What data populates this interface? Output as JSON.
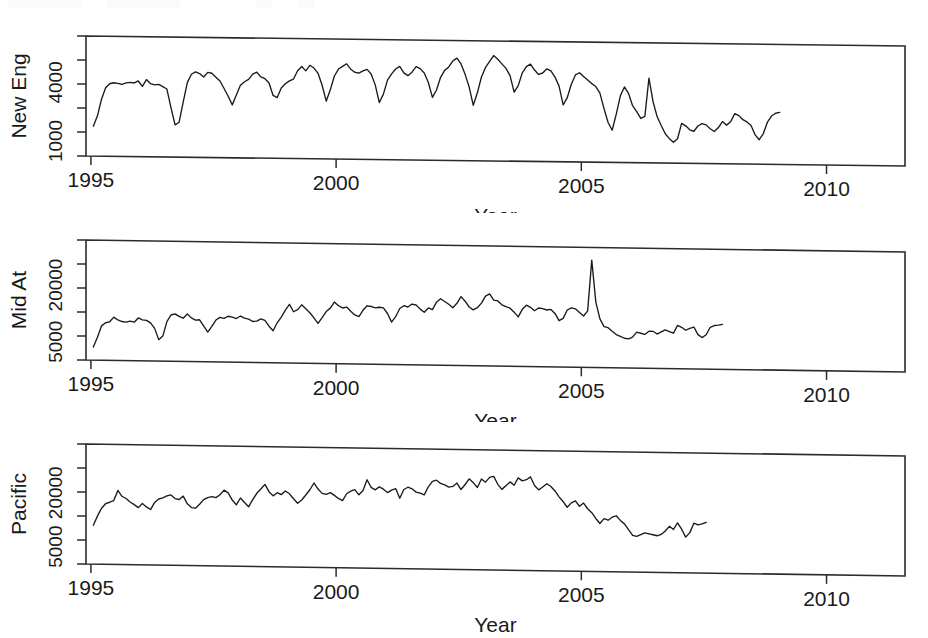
{
  "figure": {
    "kind": "multi-panel-time-series",
    "panel_count": 3,
    "background_color": "#ffffff",
    "line_color": "#1a1a1a"
  },
  "panels": [
    {
      "id": "new-eng",
      "ylabel": "New Eng",
      "xlabel": "Year",
      "yticklabels": [
        "1000",
        "4000"
      ],
      "xticklabels": [
        "1995",
        "2000",
        "2005",
        "2010"
      ]
    },
    {
      "id": "mid-at",
      "ylabel": "Mid At",
      "xlabel": "Year",
      "yticklabels": [
        "5000",
        "20000"
      ],
      "xticklabels": [
        "1995",
        "2000",
        "2005",
        "2010"
      ]
    },
    {
      "id": "pacific",
      "ylabel": "Pacific",
      "xlabel": "Year",
      "yticklabels": [
        "5000",
        "20000"
      ],
      "xticklabels": [
        "1995",
        "2000",
        "2005",
        "2010"
      ]
    }
  ],
  "chart_data": [
    {
      "type": "line",
      "title": "",
      "xlabel": "Year",
      "ylabel": "New Eng",
      "yscale": "log",
      "grid": false,
      "legend": "none",
      "xlim": [
        1994.9,
        2011.6
      ],
      "ylim": [
        700,
        12000
      ],
      "xticks": [
        1995,
        2000,
        2005,
        2010
      ],
      "yticks": [
        1000,
        4000
      ],
      "ytick_labels": [
        "1000",
        "4000"
      ],
      "x_start": 1995.05,
      "x_step": 0.0833,
      "values": [
        1420,
        1820,
        2700,
        3550,
        3900,
        4000,
        3950,
        3850,
        4000,
        4050,
        4000,
        4200,
        3700,
        4350,
        3950,
        3850,
        3900,
        3700,
        3500,
        2250,
        1500,
        1600,
        2600,
        4100,
        5000,
        5300,
        5100,
        4700,
        5250,
        5150,
        4700,
        4300,
        3600,
        3000,
        2450,
        3100,
        3900,
        4250,
        4500,
        5100,
        5350,
        4800,
        4600,
        4150,
        3100,
        2950,
        3700,
        4100,
        4400,
        4600,
        5600,
        6200,
        5600,
        6400,
        6000,
        5300,
        4000,
        2750,
        3600,
        5000,
        5900,
        6300,
        6700,
        5900,
        5500,
        5400,
        5700,
        5900,
        5300,
        4100,
        2700,
        3300,
        4600,
        5350,
        6000,
        6400,
        5500,
        5150,
        5600,
        6400,
        6100,
        5500,
        4400,
        3100,
        3700,
        5000,
        5900,
        6400,
        7400,
        7900,
        6900,
        5400,
        4000,
        2600,
        3500,
        5100,
        6400,
        7400,
        8500,
        7800,
        7000,
        6300,
        5300,
        3600,
        4200,
        5700,
        6600,
        7000,
        6100,
        5500,
        5700,
        6300,
        6000,
        5200,
        4200,
        2700,
        3200,
        4400,
        5500,
        5800,
        5300,
        4900,
        4500,
        4200,
        3600,
        2500,
        1800,
        1500,
        2200,
        3400,
        4200,
        3600,
        2700,
        2350,
        2000,
        2100,
        5200,
        3000,
        2100,
        1700,
        1400,
        1250,
        1150,
        1250,
        1800,
        1700,
        1550,
        1500,
        1700,
        1800,
        1750,
        1600,
        1500,
        1650,
        1900,
        1750,
        1900,
        2300,
        2200,
        2000,
        1900,
        1750,
        1400,
        1250,
        1450,
        1900,
        2200,
        2350,
        2400
      ]
    },
    {
      "type": "line",
      "title": "",
      "xlabel": "Year",
      "ylabel": "Mid At",
      "yscale": "log",
      "grid": false,
      "legend": "none",
      "xlim": [
        1994.9,
        2011.6
      ],
      "ylim": [
        3200,
        60000
      ],
      "xticks": [
        1995,
        2000,
        2005,
        2010
      ],
      "yticks": [
        5000,
        20000
      ],
      "ytick_labels": [
        "5000",
        "20000"
      ],
      "x_start": 1995.05,
      "x_step": 0.0833,
      "values": [
        4400,
        5600,
        7400,
        8000,
        8200,
        9200,
        8600,
        8300,
        8200,
        8400,
        8200,
        9100,
        8700,
        8600,
        8100,
        7100,
        5400,
        5900,
        8400,
        9900,
        10200,
        9600,
        9200,
        10200,
        9300,
        8800,
        8900,
        7700,
        6600,
        7600,
        8900,
        9500,
        9300,
        9800,
        9600,
        9300,
        9900,
        9400,
        9200,
        8700,
        8800,
        9300,
        9000,
        7800,
        7000,
        8500,
        9800,
        11600,
        13400,
        11200,
        11800,
        13300,
        12100,
        11000,
        9700,
        8500,
        9800,
        11400,
        12400,
        14400,
        13200,
        12500,
        12800,
        11600,
        10600,
        10200,
        11900,
        13300,
        13100,
        12700,
        12900,
        12700,
        11100,
        9000,
        10300,
        12600,
        13500,
        13100,
        14100,
        13800,
        12500,
        11600,
        12900,
        12400,
        14900,
        16200,
        15200,
        14200,
        13100,
        14600,
        17200,
        15400,
        13400,
        12500,
        13200,
        14800,
        17600,
        18600,
        16000,
        15700,
        14300,
        13700,
        13200,
        12000,
        10700,
        12900,
        14300,
        13600,
        12500,
        13400,
        13200,
        12800,
        13000,
        11800,
        9900,
        10500,
        12900,
        13600,
        13300,
        12200,
        11200,
        12700,
        44000,
        15800,
        10500,
        8700,
        8500,
        7800,
        7200,
        6900,
        6600,
        6500,
        6800,
        7700,
        7500,
        7300,
        7900,
        7900,
        7400,
        7800,
        8200,
        7900,
        7600,
        9200,
        8800,
        8200,
        8600,
        8900,
        7400,
        6900,
        7400,
        8900,
        9300,
        9400,
        9600
      ]
    },
    {
      "type": "line",
      "title": "",
      "xlabel": "Year",
      "ylabel": "Pacific",
      "yscale": "log",
      "grid": false,
      "legend": "none",
      "xlim": [
        1994.9,
        2011.6
      ],
      "ylim": [
        3200,
        70000
      ],
      "xticks": [
        1995,
        2000,
        2005,
        2010
      ],
      "yticks": [
        5000,
        20000
      ],
      "ytick_labels": [
        "5000",
        "20000"
      ],
      "x_start": 1995.05,
      "x_step": 0.0833,
      "values": [
        8700,
        11000,
        13500,
        15200,
        15800,
        16500,
        21500,
        18500,
        17500,
        16000,
        15000,
        13900,
        15500,
        14200,
        13300,
        16000,
        17500,
        18000,
        19000,
        19500,
        17800,
        17400,
        19000,
        15600,
        14200,
        14000,
        15500,
        17500,
        18500,
        19000,
        18500,
        20000,
        22500,
        21000,
        17500,
        15500,
        18500,
        16500,
        14800,
        17800,
        21000,
        23500,
        26500,
        22000,
        19800,
        21500,
        20500,
        22500,
        21000,
        18500,
        16500,
        18000,
        20500,
        23500,
        28000,
        24000,
        21500,
        21000,
        22000,
        20500,
        19000,
        18000,
        21500,
        23000,
        24000,
        21000,
        23500,
        31000,
        25500,
        24000,
        26000,
        24500,
        22500,
        24000,
        25000,
        19500,
        24500,
        26000,
        25000,
        23000,
        22500,
        21500,
        26500,
        30500,
        31500,
        29000,
        28000,
        26500,
        27000,
        29500,
        25000,
        28500,
        33000,
        30000,
        26500,
        33000,
        30500,
        34500,
        35500,
        29000,
        25500,
        28000,
        31000,
        28500,
        34500,
        32000,
        33000,
        35500,
        28500,
        25500,
        27500,
        30000,
        28000,
        25000,
        21500,
        19000,
        16500,
        18500,
        19500,
        17000,
        18500,
        16000,
        14500,
        12500,
        11000,
        12500,
        12000,
        13000,
        13500,
        12000,
        11000,
        9500,
        8200,
        8000,
        8400,
        8800,
        8600,
        8400,
        8200,
        8500,
        9300,
        10500,
        9700,
        11500,
        9800,
        8000,
        9000,
        11500,
        11000,
        11300,
        11800
      ]
    }
  ]
}
